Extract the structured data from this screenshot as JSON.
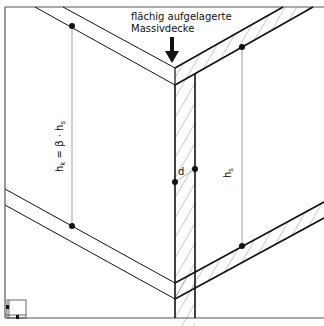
{
  "diagram": {
    "caption_line1": "flächig aufgelagerte",
    "caption_line2": "Massivdecke",
    "label_left_h": "h",
    "label_left_k": "k",
    "label_left_eq": " = β · h",
    "label_left_s": "s",
    "label_right_h": "h",
    "label_right_s": "s",
    "label_wall_thickness": "d",
    "colors": {
      "line": "#111111",
      "frame": "#555555",
      "hatch": "#444444",
      "dim": "#777777"
    }
  }
}
